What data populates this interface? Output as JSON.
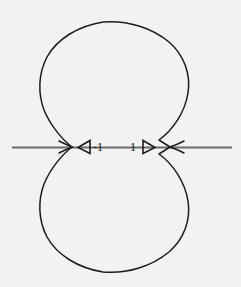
{
  "figure": {
    "background_color": "#f2f2f2",
    "width": 241,
    "height": 287,
    "curve_color": "#1c1c1c",
    "axis_color": "#6b6b6b",
    "label_color": "#111111",
    "title": ""
  },
  "axis": {
    "name": "horizontal-real-axis",
    "y": 147,
    "x_start": 12,
    "x_end": 232
  },
  "labels": {
    "left": "-1",
    "right": "1"
  },
  "markers": {
    "left": {
      "icon": "triangle-left-icon",
      "direction": "left",
      "tip_x": 78,
      "base_x": 90,
      "y": 147
    },
    "right": {
      "icon": "triangle-right-icon",
      "direction": "right",
      "tip_x": 155,
      "base_x": 143,
      "y": 147
    }
  },
  "chart_data": {
    "type": "line",
    "title": "",
    "xlabel": "",
    "ylabel": "",
    "grid": false,
    "legend": null,
    "annotations": [
      {
        "text": "-1",
        "x": -1,
        "y": 0
      },
      {
        "text": "1",
        "x": 1,
        "y": 0
      }
    ],
    "series": [
      {
        "name": "upper-lobe",
        "points_px": [
          [
            72,
            147
          ],
          [
            66,
            139
          ],
          [
            57,
            128
          ],
          [
            48,
            114
          ],
          [
            42,
            99
          ],
          [
            39,
            84
          ],
          [
            40,
            69
          ],
          [
            45,
            55
          ],
          [
            54,
            42
          ],
          [
            67,
            31
          ],
          [
            84,
            25
          ],
          [
            103,
            22
          ],
          [
            122,
            22
          ],
          [
            141,
            26
          ],
          [
            158,
            33
          ],
          [
            172,
            44
          ],
          [
            182,
            57
          ],
          [
            188,
            72
          ],
          [
            189,
            88
          ],
          [
            185,
            104
          ],
          [
            178,
            118
          ],
          [
            168,
            131
          ],
          [
            159,
            140
          ],
          [
            170,
            147
          ]
        ]
      },
      {
        "name": "lower-lobe",
        "points_px": [
          [
            72,
            147
          ],
          [
            66,
            155
          ],
          [
            57,
            166
          ],
          [
            48,
            180
          ],
          [
            42,
            195
          ],
          [
            39,
            210
          ],
          [
            40,
            225
          ],
          [
            45,
            239
          ],
          [
            54,
            252
          ],
          [
            67,
            263
          ],
          [
            84,
            269
          ],
          [
            103,
            272
          ],
          [
            122,
            272
          ],
          [
            141,
            268
          ],
          [
            158,
            261
          ],
          [
            172,
            250
          ],
          [
            182,
            237
          ],
          [
            188,
            222
          ],
          [
            189,
            206
          ],
          [
            185,
            190
          ],
          [
            178,
            176
          ],
          [
            168,
            163
          ],
          [
            159,
            154
          ],
          [
            170,
            147
          ]
        ]
      },
      {
        "name": "cusp-left-wedge",
        "points_px": [
          [
            60,
            143
          ],
          [
            72,
            147
          ],
          [
            60,
            151
          ]
        ]
      },
      {
        "name": "cusp-right-wedge",
        "points_px": [
          [
            182,
            143
          ],
          [
            170,
            147
          ],
          [
            182,
            151
          ]
        ]
      }
    ],
    "xlim_px": [
      12,
      232
    ],
    "ylim_px": [
      22,
      274
    ]
  }
}
